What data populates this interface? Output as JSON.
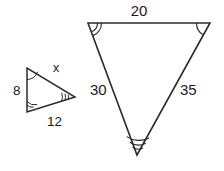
{
  "figure": {
    "type": "geometry-diagram",
    "background_color": "#ffffff",
    "stroke_color": "#2b2b2b",
    "text_color": "#1a1a1a",
    "small_triangle": {
      "name": "small-triangle",
      "vertices": {
        "top_left": {
          "x": 27,
          "y": 68,
          "angle_marks": 1
        },
        "bottom_left": {
          "x": 27,
          "y": 112,
          "angle_marks": 2
        },
        "right": {
          "x": 75,
          "y": 97,
          "angle_marks": 3
        }
      },
      "side_labels": {
        "left": "8",
        "top": "x",
        "bottom": "12"
      }
    },
    "large_triangle": {
      "name": "large-triangle",
      "vertices": {
        "top_left": {
          "x": 88,
          "y": 23,
          "angle_marks": 2
        },
        "top_right": {
          "x": 210,
          "y": 23,
          "angle_marks": 1
        },
        "bottom": {
          "x": 137,
          "y": 155,
          "angle_marks": 3
        }
      },
      "side_labels": {
        "top": "20",
        "left": "30",
        "right": "35"
      }
    }
  }
}
